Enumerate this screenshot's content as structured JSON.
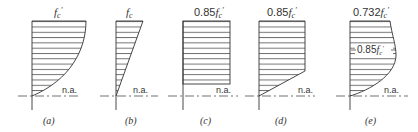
{
  "figure": {
    "panels": [
      {
        "id": "a",
        "caption": "(a)",
        "top_label": "f",
        "top_sub": "c",
        "top_prime": "′",
        "top_coef": "",
        "shape": "parabolic",
        "na_label": "n.a."
      },
      {
        "id": "b",
        "caption": "(b)",
        "top_label": "f",
        "top_sub": "c",
        "top_prime": "",
        "top_coef": "",
        "shape": "triangular",
        "na_label": "n.a."
      },
      {
        "id": "c",
        "caption": "(c)",
        "top_label": "f",
        "top_sub": "c",
        "top_prime": "′",
        "top_coef": "0.85",
        "shape": "rectangular",
        "na_label": "n.a."
      },
      {
        "id": "d",
        "caption": "(d)",
        "top_label": "f",
        "top_sub": "c",
        "top_prime": "′",
        "top_coef": "0.85",
        "shape": "trapezoidal",
        "na_label": "n.a."
      },
      {
        "id": "e",
        "caption": "(e)",
        "top_label": "f",
        "top_sub": "c",
        "top_prime": "′",
        "top_coef": "0.732",
        "shape": "curved-peak",
        "na_label": "n.a.",
        "mid_label_coef": "0.85",
        "mid_label": "f",
        "mid_sub": "c",
        "mid_prime": "′"
      }
    ]
  }
}
